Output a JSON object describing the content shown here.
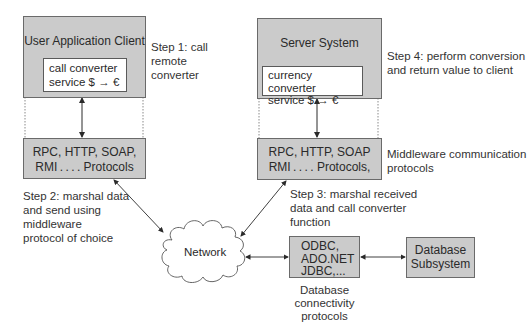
{
  "client": {
    "title": "User Application Client",
    "service_line1": "call converter",
    "service_line2": "service $ → €"
  },
  "server": {
    "title": "Server System",
    "service_line1": "currency converter",
    "service_line2": "service $ →  €"
  },
  "client_protocols": {
    "line1": "RPC, HTTP, SOAP,",
    "line2": "RMI . . . . Protocols"
  },
  "server_protocols": {
    "line1": "RPC, HTTP, SOAP",
    "line2": "RMI . . . . Protocols,"
  },
  "steps": {
    "step1": [
      "Step 1: call",
      "remote",
      "converter"
    ],
    "step2": [
      "Step 2: marshal data",
      "and send using",
      "middleware",
      "protocol of choice"
    ],
    "step3": [
      "Step 3: marshal received",
      "data and call converter",
      "function"
    ],
    "step4": [
      "Step 4: perform conversion",
      "and return value to client"
    ]
  },
  "middleware_label": [
    "Middleware communication",
    "protocols"
  ],
  "network": {
    "label": "Network"
  },
  "db_protocols": {
    "lines": [
      "ODBC,",
      "ADO.NET",
      "JDBC,..."
    ],
    "caption": [
      "Database",
      "connectivity",
      "protocols"
    ]
  },
  "db_subsystem": {
    "lines": [
      "Database",
      "Subsystem"
    ]
  },
  "colors": {
    "box_fill": "#cbcbcb",
    "line": "#3a3a3a",
    "border": "#6a6a6a"
  }
}
